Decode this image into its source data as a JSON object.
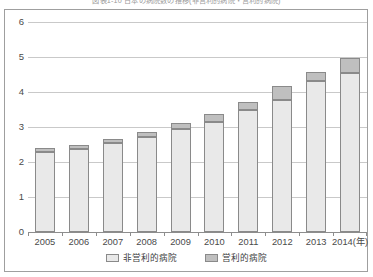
{
  "figure": {
    "title": "図表1-10  日本の病院数の推移(非営利的病院・営利的病院)",
    "frame_border_color": "#9f9f9f"
  },
  "chart_data": {
    "type": "bar",
    "stacked": true,
    "title": "",
    "xlabel": "",
    "ylabel": "",
    "categories": [
      "2005",
      "2006",
      "2007",
      "2008",
      "2009",
      "2010",
      "2011",
      "2012",
      "2013",
      "2014(年)"
    ],
    "x_tick_labels": [
      "2005",
      "2006",
      "2007",
      "2008",
      "2009",
      "2010",
      "2011",
      "2012",
      "2013",
      "2014(年)"
    ],
    "y_tick_labels": [
      "0",
      "1",
      "2",
      "3",
      "4",
      "5",
      "6"
    ],
    "y_ticks": [
      0,
      1,
      2,
      3,
      4,
      5,
      6
    ],
    "ylim": [
      0,
      6
    ],
    "grid": true,
    "legend_position": "bottom",
    "series": [
      {
        "name": "非営利的病院",
        "color": "#e9e9e9",
        "values": [
          2.29,
          2.38,
          2.55,
          2.72,
          2.94,
          3.14,
          3.48,
          3.77,
          4.31,
          4.54
        ]
      },
      {
        "name": "営利的病院",
        "color": "#bfbfbf",
        "values": [
          0.11,
          0.12,
          0.11,
          0.14,
          0.17,
          0.23,
          0.23,
          0.4,
          0.26,
          0.43
        ]
      }
    ],
    "totals": [
      2.4,
      2.5,
      2.66,
      2.86,
      3.11,
      3.37,
      3.71,
      4.17,
      4.57,
      4.97
    ]
  },
  "legend": {
    "items": [
      {
        "label": "非営利的病院",
        "swatch": "nonprofit"
      },
      {
        "label": "営利的病院",
        "swatch": "profit"
      }
    ]
  }
}
